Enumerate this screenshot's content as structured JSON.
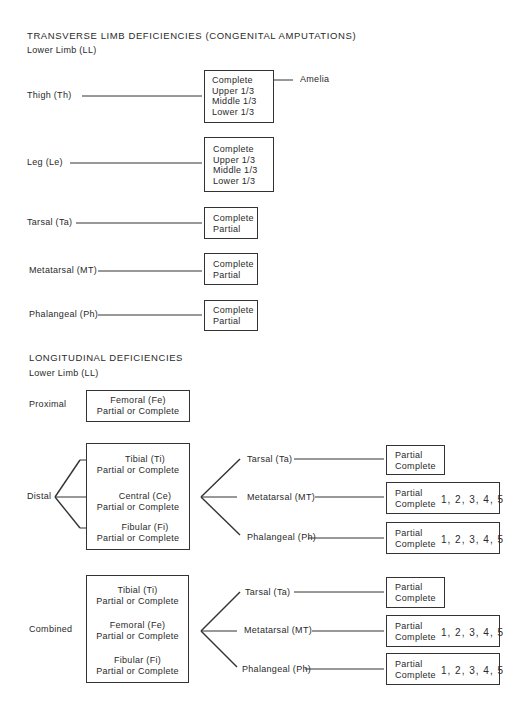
{
  "transverse": {
    "title": "TRANSVERSE LIMB DEFICIENCIES (CONGENITAL AMPUTATIONS)",
    "subtitle": "Lower Limb (LL)",
    "rows": [
      {
        "label": "Thigh (Th)",
        "options": [
          "Complete",
          "Upper 1/3",
          "Middle 1/3",
          "Lower 1/3"
        ],
        "annotation": "Amelia"
      },
      {
        "label": "Leg (Le)",
        "options": [
          "Complete",
          "Upper 1/3",
          "Middle 1/3",
          "Lower 1/3"
        ]
      },
      {
        "label": "Tarsal (Ta)",
        "options": [
          "Complete",
          "Partial"
        ]
      },
      {
        "label": "Metatarsal (MT)",
        "options": [
          "Complete",
          "Partial"
        ]
      },
      {
        "label": "Phalangeal (Ph)",
        "options": [
          "Complete",
          "Partial"
        ]
      }
    ]
  },
  "longitudinal": {
    "title": "LONGITUDINAL DEFICIENCIES",
    "subtitle": "Lower Limb (LL)",
    "proximal": {
      "label": "Proximal",
      "items": [
        {
          "name": "Femoral (Fe)",
          "detail": "Partial or Complete"
        }
      ]
    },
    "distal": {
      "label": "Distal",
      "items": [
        {
          "name": "Tibial (Ti)",
          "detail": "Partial or Complete"
        },
        {
          "name": "Central (Ce)",
          "detail": "Partial or Complete"
        },
        {
          "name": "Fibular (Fi)",
          "detail": "Partial or Complete"
        }
      ],
      "branches": [
        {
          "label": "Tarsal (Ta)",
          "options": [
            "Partial",
            "Complete"
          ],
          "rays": ""
        },
        {
          "label": "Metatarsal (MT)",
          "options": [
            "Partial",
            "Complete"
          ],
          "rays": "1, 2, 3, 4, 5"
        },
        {
          "label": "Phalangeal (Ph)",
          "options": [
            "Partial",
            "Complete"
          ],
          "rays": "1, 2, 3, 4, 5"
        }
      ]
    },
    "combined": {
      "label": "Combined",
      "items": [
        {
          "name": "Tibial (Ti)",
          "detail": "Partial or Complete"
        },
        {
          "name": "Femoral (Fe)",
          "detail": "Partial or Complete"
        },
        {
          "name": "Fibular (Fi)",
          "detail": "Partial or Complete"
        }
      ],
      "branches": [
        {
          "label": "Tarsal (Ta)",
          "options": [
            "Partial",
            "Complete"
          ],
          "rays": ""
        },
        {
          "label": "Metatarsal (MT)",
          "options": [
            "Partial",
            "Complete"
          ],
          "rays": "1, 2, 3, 4, 5"
        },
        {
          "label": "Phalangeal (Ph)",
          "options": [
            "Partial",
            "Complete"
          ],
          "rays": "1, 2, 3, 4, 5"
        }
      ]
    }
  }
}
